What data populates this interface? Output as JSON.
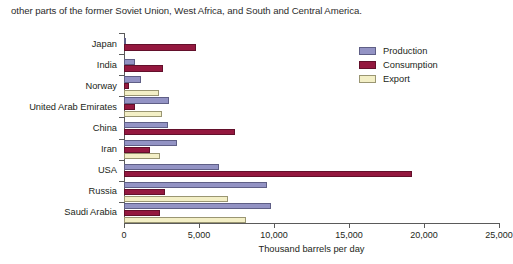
{
  "intro": {
    "text": "other parts of the former Soviet Union, West Africa, and South and Central America."
  },
  "chart_data": {
    "type": "bar",
    "orientation": "horizontal",
    "title": "",
    "xlabel": "Thousand barrels per day",
    "ylabel": "",
    "xlim": [
      0,
      25000
    ],
    "xticks": [
      0,
      5000,
      10000,
      15000,
      20000,
      25000
    ],
    "xtick_labels": [
      "0",
      "5,000",
      "10,000",
      "15,000",
      "20,000",
      "25,000"
    ],
    "grid": false,
    "legend_position": "top-right",
    "categories": [
      "Japan",
      "India",
      "Norway",
      "United Arab Emirates",
      "China",
      "Iran",
      "USA",
      "Russia",
      "Saudi Arabia"
    ],
    "series": [
      {
        "name": "Production",
        "color": "#9393c4",
        "values": [
          130,
          700,
          1100,
          3000,
          2900,
          3500,
          6300,
          9500,
          9800
        ]
      },
      {
        "name": "Consumption",
        "color": "#94183f",
        "values": [
          4800,
          2600,
          300,
          700,
          7400,
          1700,
          19200,
          2700,
          2400
        ]
      },
      {
        "name": "Export",
        "color": "#f3efc6",
        "values": [
          0,
          0,
          2300,
          2500,
          0,
          2400,
          0,
          6900,
          8100
        ]
      }
    ]
  }
}
